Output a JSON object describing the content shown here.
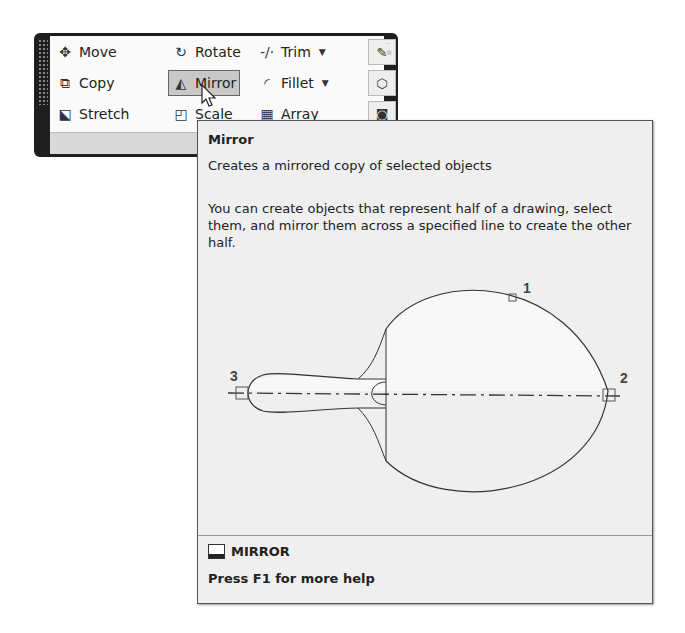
{
  "ribbon": {
    "panel_label": "Modify",
    "panel_label_visible": "M",
    "tools": [
      {
        "label": "Move",
        "icon": "move-icon"
      },
      {
        "label": "Rotate",
        "icon": "rotate-icon"
      },
      {
        "label": "Trim",
        "icon": "trim-icon",
        "dropdown": true
      },
      {
        "label": "Copy",
        "icon": "copy-icon"
      },
      {
        "label": "Mirror",
        "icon": "mirror-icon",
        "active": true
      },
      {
        "label": "Fillet",
        "icon": "fillet-icon",
        "dropdown": true
      },
      {
        "label": "Stretch",
        "icon": "stretch-icon"
      },
      {
        "label": "Scale",
        "icon": "scale-icon"
      },
      {
        "label": "Array",
        "icon": "array-icon"
      }
    ]
  },
  "tooltip": {
    "title": "Mirror",
    "description": "Creates a mirrored copy of selected objects",
    "body": "You can create objects that represent half of a drawing, select them, and mirror them across a specified line to create the other half.",
    "command": "MIRROR",
    "help": "Press F1 for more help",
    "diagram_points": [
      "1",
      "2",
      "3"
    ]
  }
}
